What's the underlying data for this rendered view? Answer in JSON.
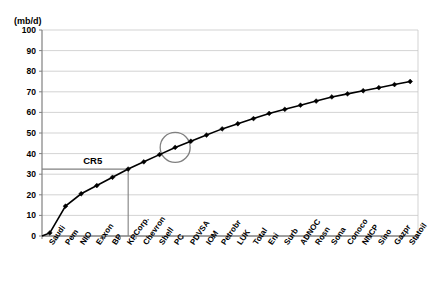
{
  "chart_data": {
    "type": "line",
    "title": "",
    "subtitle": "",
    "xlabel": "",
    "ylabel": "(mb/d)",
    "ylim": [
      0,
      100
    ],
    "ytick_step": 10,
    "yticks": [
      "0",
      "10",
      "20",
      "30",
      "40",
      "50",
      "60",
      "70",
      "80",
      "90",
      "100"
    ],
    "grid": true,
    "legend": "none",
    "categories": [
      "Saudi",
      "Pem",
      "NIO",
      "Exxon",
      "BP",
      "KPCorp.",
      "Chevron",
      "Shell",
      "PC",
      "PDVSA",
      "IOM",
      "Petrobr",
      "LUK",
      "Total",
      "Eni",
      "Surb",
      "ADNOC",
      "Rosn",
      "Sona",
      "Conoco",
      "NNCP",
      "Sino",
      "Gazpr",
      "Statoil"
    ],
    "series": [
      {
        "name": "Cumulative production",
        "values": [
          1.5,
          14.5,
          20.5,
          24.5,
          28.5,
          32.5,
          36.0,
          39.5,
          43.0,
          46.0,
          49.0,
          52.0,
          54.5,
          57.0,
          59.5,
          61.5,
          63.5,
          65.5,
          67.5,
          69.0,
          70.5,
          72.0,
          73.5,
          75.0
        ]
      }
    ],
    "annotations": [
      {
        "name": "cr5-label",
        "text": "CR5",
        "type": "text",
        "x_index": 2,
        "y_value": 36
      },
      {
        "name": "cr5-horizontal-line",
        "type": "hline",
        "y_value": 32.5,
        "from_x_index": 0,
        "to_x_index": 5
      },
      {
        "name": "cr5-vertical-line",
        "type": "vline",
        "x_index": 5,
        "from_y": 0,
        "to_y": 32.5
      },
      {
        "name": "highlight-circle",
        "type": "circle",
        "x_index": 8,
        "y_value": 43.0,
        "radius_px": 15
      }
    ],
    "colors": {
      "line": "#000000",
      "marker": "#000000",
      "grid": "#c8c8c8",
      "axis": "#808080",
      "plot_background": "#ffffff",
      "annotation": "#808080",
      "cr5_line": "#808080"
    }
  }
}
